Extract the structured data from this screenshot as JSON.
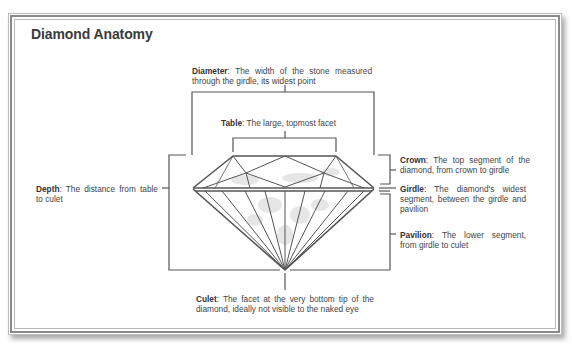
{
  "title": "Diamond Anatomy",
  "labels": {
    "diameter": {
      "term": "Diameter",
      "text": ": The width of the stone measured through the girdle, its widest point"
    },
    "table": {
      "term": "Table",
      "text": ": The large, topmost facet"
    },
    "crown": {
      "term": "Crown",
      "text": ": The top segment of the diamond, from crown to girdle"
    },
    "girdle": {
      "term": "Girdle",
      "text": ": The diamond's widest segment, between the girdle and pavilion"
    },
    "pavilion": {
      "term": "Pavilion",
      "text": ": The lower segment, from girdle to culet"
    },
    "depth": {
      "term": "Depth",
      "text": ": The distance from table to culet"
    },
    "culet": {
      "term": "Culet",
      "text": ": The facet at the very bottom tip of the diamond, ideally not visible to the naked eye"
    }
  },
  "colors": {
    "line": "#555555",
    "frame": "#8a8a8a"
  }
}
